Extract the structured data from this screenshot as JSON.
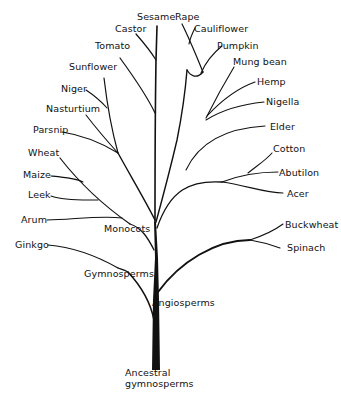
{
  "diagram": {
    "type": "phylogenetic-tree",
    "colors": {
      "ink": "#111111",
      "background": "#ffffff"
    },
    "root": {
      "label_line1": "Ancestral",
      "label_line2": "gymnosperms"
    },
    "clades": {
      "angiosperms": "Angiosperms",
      "gymnosperms": "Gymnosperms",
      "monocots": "Monocots"
    },
    "taxa": {
      "sesame": "Sesame",
      "castor": "Castor",
      "tomato": "Tomato",
      "sunflower": "Sunflower",
      "niger": "Niger",
      "nasturtium": "Nasturtium",
      "parsnip": "Parsnip",
      "wheat": "Wheat",
      "maize": "Maize",
      "leek": "Leek",
      "arum": "Arum",
      "ginkgo": "Ginkgo",
      "rape": "Rape",
      "cauliflower": "Cauliflower",
      "pumpkin": "Pumpkin",
      "mung_bean": "Mung bean",
      "hemp": "Hemp",
      "nigella": "Nigella",
      "elder": "Elder",
      "cotton": "Cotton",
      "abutilon": "Abutilon",
      "acer": "Acer",
      "buckwheat": "Buckwheat",
      "spinach": "Spinach"
    }
  }
}
